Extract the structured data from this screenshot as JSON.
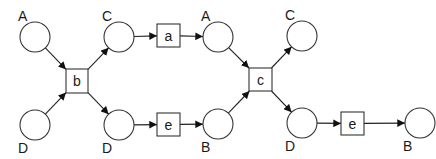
{
  "diagram": {
    "type": "petri-net",
    "places": [
      {
        "id": "p1",
        "label": "A",
        "cx": 35,
        "cy": 37,
        "label_pos": "top"
      },
      {
        "id": "p2",
        "label": "D",
        "cx": 35,
        "cy": 125,
        "label_pos": "bottom"
      },
      {
        "id": "p3",
        "label": "C",
        "cx": 119,
        "cy": 37,
        "label_pos": "top"
      },
      {
        "id": "p4",
        "label": "D",
        "cx": 119,
        "cy": 125,
        "label_pos": "bottom"
      },
      {
        "id": "p5",
        "label": "A",
        "cx": 218,
        "cy": 37,
        "label_pos": "top"
      },
      {
        "id": "p6",
        "label": "B",
        "cx": 218,
        "cy": 124,
        "label_pos": "bottom"
      },
      {
        "id": "p7",
        "label": "C",
        "cx": 302,
        "cy": 36,
        "label_pos": "top"
      },
      {
        "id": "p8",
        "label": "D",
        "cx": 302,
        "cy": 123,
        "label_pos": "bottom"
      },
      {
        "id": "p9",
        "label": "B",
        "cx": 420,
        "cy": 123,
        "label_pos": "bottom"
      }
    ],
    "transitions": [
      {
        "id": "t1",
        "label": "b",
        "x": 66,
        "y": 69,
        "w": 22,
        "h": 24
      },
      {
        "id": "t2",
        "label": "a",
        "x": 157,
        "y": 24,
        "w": 23,
        "h": 23
      },
      {
        "id": "t3",
        "label": "e",
        "x": 157,
        "y": 113,
        "w": 23,
        "h": 23
      },
      {
        "id": "t4",
        "label": "c",
        "x": 249,
        "y": 68,
        "w": 23,
        "h": 23
      },
      {
        "id": "t5",
        "label": "e",
        "x": 341,
        "y": 112,
        "w": 23,
        "h": 23
      }
    ],
    "arcs": [
      {
        "from": "p1",
        "to": "t1"
      },
      {
        "from": "p2",
        "to": "t1"
      },
      {
        "from": "t1",
        "to": "p3"
      },
      {
        "from": "t1",
        "to": "p4"
      },
      {
        "from": "p3",
        "to": "t2"
      },
      {
        "from": "p4",
        "to": "t3"
      },
      {
        "from": "t2",
        "to": "p5"
      },
      {
        "from": "t3",
        "to": "p6"
      },
      {
        "from": "p5",
        "to": "t4"
      },
      {
        "from": "p6",
        "to": "t4"
      },
      {
        "from": "t4",
        "to": "p7"
      },
      {
        "from": "t4",
        "to": "p8"
      },
      {
        "from": "p8",
        "to": "t5"
      },
      {
        "from": "t5",
        "to": "p9"
      }
    ]
  },
  "style": {
    "place_radius": 15,
    "stroke_color": "#333333",
    "fill_color": "#ffffff"
  }
}
